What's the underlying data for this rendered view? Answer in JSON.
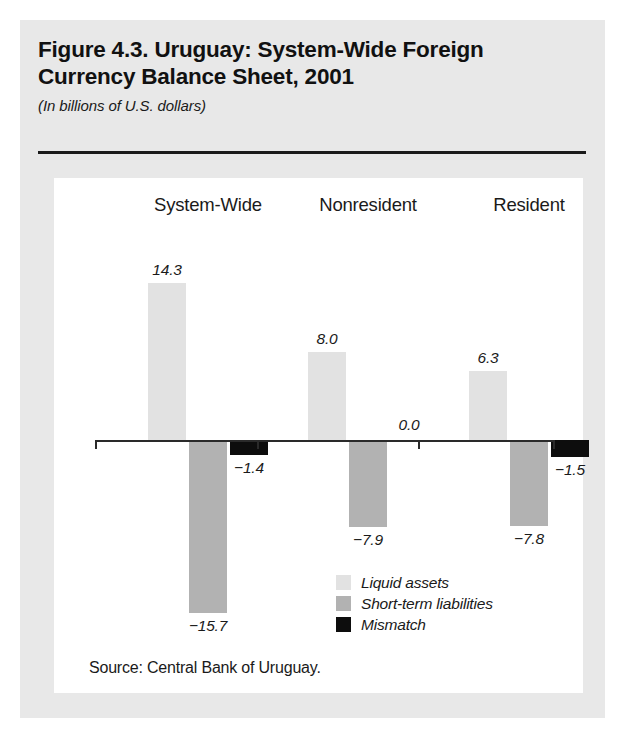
{
  "figure": {
    "title": "Figure 4.3. Uruguay: System-Wide Foreign Currency Balance Sheet, 2001",
    "title_line1": "Figure 4.3. Uruguay: System-Wide Foreign",
    "title_line2": "Currency Balance Sheet, 2001",
    "subtitle": "(In billions of U.S. dollars)",
    "source": "Source: Central Bank of Uruguay."
  },
  "colors": {
    "liquid_assets": "#e2e2e2",
    "short_term_liabilities": "#b2b2b2",
    "mismatch": "#0d0d0d",
    "panel_background": "#e8e8e8",
    "plot_background": "#ffffff",
    "axis": "#2a2a2a",
    "text": "#1a1a1a"
  },
  "legend": {
    "position": "inside-bottom-right",
    "items": [
      {
        "label": "Liquid assets",
        "color": "#e2e2e2"
      },
      {
        "label": "Short-term liabilities",
        "color": "#b2b2b2"
      },
      {
        "label": "Mismatch",
        "color": "#0d0d0d"
      }
    ]
  },
  "chart_data": {
    "type": "bar",
    "title": "Figure 4.3. Uruguay: System-Wide Foreign Currency Balance Sheet, 2001",
    "subtitle": "(In billions of U.S. dollars)",
    "xlabel": "",
    "ylabel": "",
    "ylim": [
      -16.5,
      15.5
    ],
    "grid": false,
    "zero_line": true,
    "categories": [
      "System-Wide",
      "Nonresident",
      "Resident"
    ],
    "series": [
      {
        "name": "Liquid assets",
        "color": "#e2e2e2",
        "values": [
          14.3,
          8.0,
          6.3
        ],
        "labels": [
          "14.3",
          "8.0",
          "6.3"
        ]
      },
      {
        "name": "Short-term liabilities",
        "color": "#b2b2b2",
        "values": [
          -15.7,
          -7.9,
          -7.8
        ],
        "labels": [
          "−15.7",
          "−7.9",
          "−7.8"
        ]
      },
      {
        "name": "Mismatch",
        "color": "#0d0d0d",
        "values": [
          -1.4,
          0.0,
          -1.5
        ],
        "labels": [
          "−1.4",
          "0.0",
          "−1.5"
        ]
      }
    ],
    "source": "Source: Central Bank of Uruguay."
  }
}
